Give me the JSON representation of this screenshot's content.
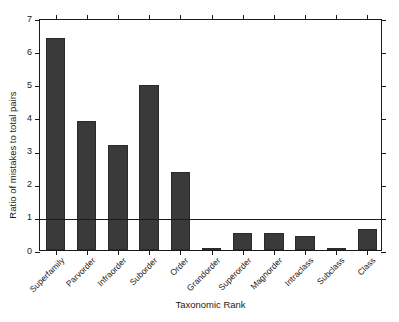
{
  "chart_data": {
    "type": "bar",
    "title": "",
    "xlabel": "Taxonomic Rank",
    "ylabel": "Ratio of mistakes to total pairs",
    "categories": [
      "Superfamily",
      "Parvorder",
      "Infraorder",
      "Suborder",
      "Order",
      "Grandorder",
      "Superorder",
      "Magnorder",
      "Intraclass",
      "Subclass",
      "Class"
    ],
    "values": [
      6.4,
      3.88,
      3.18,
      4.97,
      2.35,
      0.02,
      0.5,
      0.52,
      0.42,
      0.02,
      0.62
    ],
    "ylim": [
      0,
      7
    ],
    "ytick_labels": [
      "0",
      "1",
      "2",
      "3",
      "4",
      "5",
      "6",
      "7"
    ],
    "ytick_values": [
      0,
      1,
      2,
      3,
      4,
      5,
      6,
      7
    ],
    "grid": false,
    "legend": "none",
    "annotations": [
      {
        "type": "hline",
        "value": 1,
        "label": "reference line at ratio = 1"
      }
    ],
    "bar_color": "#3a3a3a",
    "axis_color": "#1a1a1a",
    "background_color": "#ffffff"
  }
}
